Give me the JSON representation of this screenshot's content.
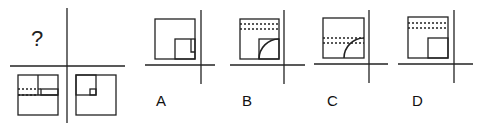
{
  "puzzle": {
    "question_mark": "?",
    "grid": {
      "top_left": "question",
      "top_right": "empty",
      "bottom_left": "square with inner vertical line, dashed horizontal pair, small rectangle at right",
      "bottom_right": "square with inner square in top-left and small square corner"
    }
  },
  "options": [
    {
      "label": "A",
      "description": "square with inner square bottom-right and small notch"
    },
    {
      "label": "B",
      "description": "square with two dashed lines at top and quarter arc inside lower-right square"
    },
    {
      "label": "C",
      "description": "square with two dashed lines in middle and quarter arc at bottom-right"
    },
    {
      "label": "D",
      "description": "square with two dashed lines at top and inner square bottom-right"
    }
  ],
  "colors": {
    "stroke": "#222222",
    "background": "#ffffff"
  }
}
